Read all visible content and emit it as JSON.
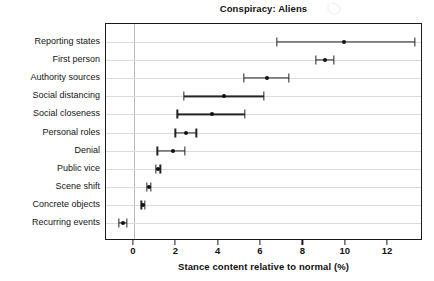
{
  "chart_data": {
    "type": "scatter",
    "title": "Conspiracy: Aliens",
    "xlabel": "Stance content relative to normal (%)",
    "ylabel": "",
    "orientation": "horizontal",
    "grid": true,
    "legend": "none",
    "xlim": [
      -1.32,
      13.65
    ],
    "xticks": [
      0,
      2,
      4,
      6,
      8,
      10,
      12
    ],
    "xticklabels": [
      "0",
      "2",
      "4",
      "6",
      "8",
      "10",
      "12"
    ],
    "reference_line": 0,
    "categories": [
      "Reporting states",
      "First person",
      "Authority sources",
      "Social distancing",
      "Social closeness",
      "Personal roles",
      "Denial",
      "Public vice",
      "Scene shift",
      "Concrete objects",
      "Recurring events"
    ],
    "values": [
      9.9,
      9.0,
      6.3,
      4.25,
      3.7,
      2.45,
      1.85,
      1.15,
      0.7,
      0.42,
      -0.52
    ],
    "ci_low": [
      6.75,
      8.6,
      5.2,
      2.35,
      2.05,
      1.95,
      1.1,
      1.05,
      0.6,
      0.35,
      -0.7
    ],
    "ci_high": [
      13.25,
      9.45,
      7.3,
      6.15,
      5.25,
      2.95,
      2.4,
      1.25,
      0.8,
      0.5,
      -0.35
    ],
    "point_color": "#111111",
    "line_color": "#232323",
    "grid_color": "#dcdcdc",
    "axis_color": "#1a1a1a"
  }
}
